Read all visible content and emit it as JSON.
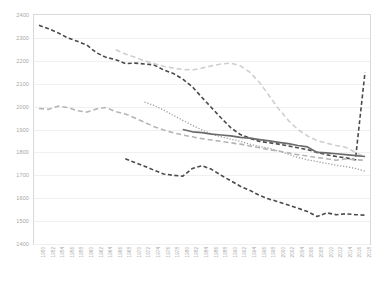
{
  "chart_data": {
    "type": "line",
    "title": "",
    "xlabel": "",
    "ylabel": "",
    "ylim": [
      1400,
      2400
    ],
    "ytick_step": 100,
    "grid": true,
    "legend": "none",
    "yticks": [
      2400,
      2300,
      2200,
      2100,
      2000,
      1900,
      1800,
      1700,
      1600,
      1500,
      1400
    ],
    "x": [
      1950,
      1952,
      1954,
      1956,
      1958,
      1960,
      1962,
      1964,
      1966,
      1968,
      1970,
      1972,
      1974,
      1976,
      1978,
      1980,
      1982,
      1984,
      1986,
      1988,
      1990,
      1992,
      1994,
      1996,
      1998,
      2000,
      2002,
      2004,
      2006,
      2008,
      2010,
      2012,
      2014,
      2016,
      2018
    ],
    "categories": [
      "1950",
      "1952",
      "1954",
      "1956",
      "1958",
      "1960",
      "1962",
      "1964",
      "1966",
      "1968",
      "1970",
      "1972",
      "1974",
      "1976",
      "1978",
      "1980",
      "1982",
      "1984",
      "1986",
      "1988",
      "1990",
      "1992",
      "1994",
      "1996",
      "1998",
      "2000",
      "2002",
      "2004",
      "2006",
      "2008",
      "2010",
      "2012",
      "2014",
      "2016",
      "2018"
    ],
    "series": [
      {
        "name": "series-dark-dashed-high",
        "style": "dashed",
        "color": "#4a4a4a",
        "width": 1.6,
        "dash": "4,2.5",
        "values": [
          2355,
          2340,
          2322,
          2300,
          2285,
          2268,
          2235,
          2215,
          2205,
          2188,
          2190,
          2186,
          2182,
          2160,
          2145,
          2120,
          2086,
          2040,
          1995,
          1950,
          1908,
          1878,
          1862,
          1848,
          1842,
          1836,
          1828,
          1820,
          1812,
          1800,
          1790,
          1782,
          1776,
          1768,
          2150
        ]
      },
      {
        "name": "series-light-gray-dashed",
        "style": "dashed",
        "color": "#cfcfcf",
        "width": 1.6,
        "dash": "5,3",
        "values": [
          null,
          null,
          null,
          null,
          null,
          null,
          null,
          null,
          2248,
          2230,
          2216,
          2200,
          2188,
          2176,
          2168,
          2162,
          2160,
          2168,
          2178,
          2186,
          2190,
          2178,
          2150,
          2105,
          2048,
          1990,
          1940,
          1900,
          1872,
          1852,
          1840,
          1830,
          1822,
          1800,
          1780
        ]
      },
      {
        "name": "series-dotted",
        "style": "dotted",
        "color": "#9b9b9b",
        "width": 1.3,
        "dash": "1.2,1.8",
        "values": [
          null,
          null,
          null,
          null,
          null,
          null,
          null,
          null,
          null,
          null,
          null,
          2020,
          2005,
          1985,
          1962,
          1940,
          1918,
          1898,
          1880,
          1868,
          1858,
          1848,
          1836,
          1826,
          1818,
          1806,
          1792,
          1778,
          1768,
          1760,
          1752,
          1744,
          1738,
          1730,
          1718
        ]
      },
      {
        "name": "series-medium-gray-dashed",
        "style": "dashed",
        "color": "#b5b5b5",
        "width": 1.6,
        "dash": "5,3",
        "values": [
          1992,
          1988,
          2002,
          1996,
          1982,
          1976,
          1990,
          1996,
          1978,
          1968,
          1950,
          1932,
          1912,
          1898,
          1886,
          1876,
          1868,
          1860,
          1854,
          1848,
          1842,
          1836,
          1828,
          1820,
          1812,
          1806,
          1798,
          1790,
          1784,
          1778,
          1772,
          1766,
          1772,
          1768,
          1766
        ]
      },
      {
        "name": "series-solid-dark",
        "style": "solid",
        "color": "#6b6b6b",
        "width": 1.7,
        "dash": "none",
        "values": [
          null,
          null,
          null,
          null,
          null,
          null,
          null,
          null,
          null,
          null,
          null,
          null,
          null,
          null,
          null,
          1900,
          1890,
          1886,
          1880,
          1876,
          1872,
          1866,
          1862,
          1856,
          1850,
          1844,
          1838,
          1830,
          1824,
          1800,
          1798,
          1794,
          1790,
          1786,
          1782
        ]
      },
      {
        "name": "series-dark-dashed-low",
        "style": "dashed",
        "color": "#4a4a4a",
        "width": 1.6,
        "dash": "4,2.5",
        "values": [
          null,
          null,
          null,
          null,
          null,
          null,
          null,
          null,
          null,
          1772,
          1756,
          1740,
          1722,
          1706,
          1700,
          1696,
          1730,
          1742,
          1726,
          1700,
          1676,
          1652,
          1634,
          1612,
          1596,
          1584,
          1570,
          1556,
          1542,
          1520,
          1536,
          1528,
          1532,
          1528,
          1526
        ]
      }
    ]
  }
}
